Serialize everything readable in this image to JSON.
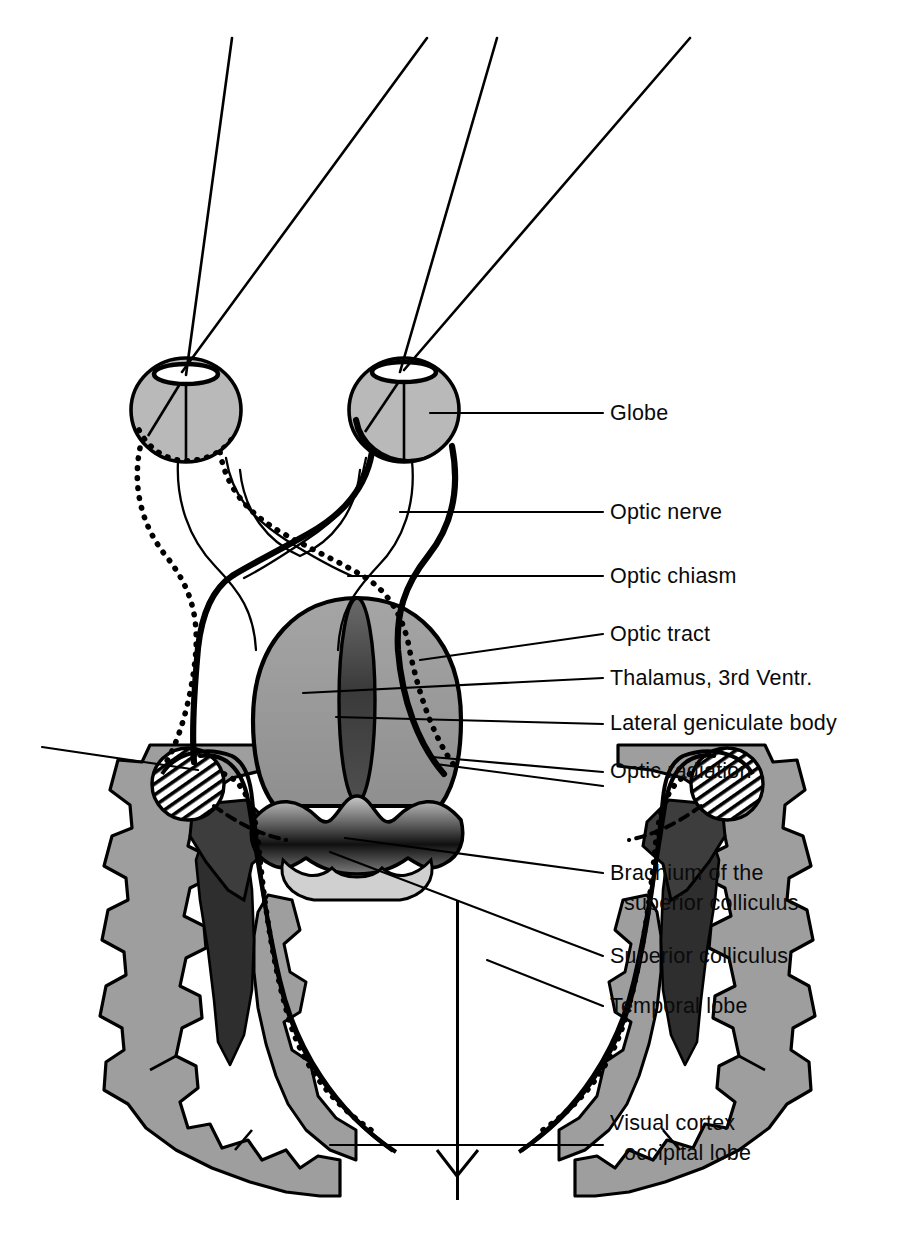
{
  "figure": {
    "type": "anatomical-diagram",
    "orientation": "axial / horizontal section, viewed from above",
    "background_color": "#ffffff",
    "line_color": "#000000"
  },
  "palette": {
    "ink": "#000000",
    "globe_fill": "#b9b9b9",
    "thalamus_fill": "#9a9a9a",
    "third_ventricle_fill": "#4a4a4a",
    "colliculus_fill": "#3d3d3d",
    "colliculus_dark": "#111111",
    "cortex_gray_matter": "#9e9e9e",
    "white_matter": "#ffffff",
    "ventricle_dark": "#2e2e2e",
    "lgb_hatch": "#000000"
  },
  "labels": [
    {
      "id": "globe",
      "line1": "Globe",
      "line2": "",
      "x": 610,
      "y": 420,
      "leader": {
        "x1": 603,
        "y1": 413,
        "x2": 430,
        "y2": 413
      }
    },
    {
      "id": "optic-nerve",
      "line1": "Optic  nerve",
      "line2": "",
      "x": 610,
      "y": 519,
      "leader": {
        "x1": 603,
        "y1": 512,
        "x2": 400,
        "y2": 512
      }
    },
    {
      "id": "optic-chiasm",
      "line1": "Optic  chiasm",
      "line2": "",
      "x": 610,
      "y": 583,
      "leader": {
        "x1": 603,
        "y1": 576,
        "x2": 348,
        "y2": 576
      }
    },
    {
      "id": "optic-tract",
      "line1": "Optic  tract",
      "line2": "",
      "x": 610,
      "y": 641,
      "leader": {
        "x1": 603,
        "y1": 634,
        "x2": 420,
        "y2": 660
      }
    },
    {
      "id": "thalamus",
      "line1": "Thalamus, 3rd  Ventr.",
      "line2": "",
      "x": 610,
      "y": 685,
      "leader": {
        "x1": 603,
        "y1": 678,
        "x2": 303,
        "y2": 693
      }
    },
    {
      "id": "lateral-geniculate",
      "line1": "Lateral  geniculate  body",
      "line2": "",
      "x": 610,
      "y": 730,
      "leader": {
        "x1": 603,
        "y1": 724,
        "x2": 336,
        "y2": 717
      }
    },
    {
      "id": "optic-radiation",
      "line1": "Optic  radiation",
      "line2": "",
      "x": 610,
      "y": 778,
      "leader": {
        "x1": 603,
        "y1": 772,
        "x2": 432,
        "y2": 757
      }
    },
    {
      "id": "brachium",
      "line1": "Brachium of the",
      "line2": "superior  colliculus",
      "x": 610,
      "y": 880,
      "leader": {
        "x1": 603,
        "y1": 873,
        "x2": 345,
        "y2": 838
      }
    },
    {
      "id": "superior-colliculus",
      "line1": "Superior  colliculus",
      "line2": "",
      "x": 610,
      "y": 963,
      "leader": {
        "x1": 603,
        "y1": 956,
        "x2": 330,
        "y2": 852
      }
    },
    {
      "id": "temporal-lobe",
      "line1": "Temporal  lobe",
      "line2": "",
      "x": 610,
      "y": 1013,
      "leader": {
        "x1": 603,
        "y1": 1006,
        "x2": 487,
        "y2": 960
      }
    },
    {
      "id": "visual-cortex",
      "line1": "Visual  cortex",
      "line2": "occipital  lobe",
      "x": 610,
      "y": 1130,
      "leader": {
        "x1": 603,
        "y1": 1145,
        "x2": 330,
        "y2": 1145
      }
    }
  ],
  "extra_leaders": [
    {
      "id": "optic-radiation-second",
      "x1": 603,
      "y1": 786,
      "x2": 436,
      "y2": 764
    },
    {
      "id": "lgb-left-leader",
      "x1": 198,
      "y1": 770,
      "x2": 42,
      "y2": 747
    }
  ],
  "visual_field_rays": [
    {
      "id": "ray-left-outer",
      "x1": 232,
      "y1": 38,
      "x2": 186,
      "y2": 375
    },
    {
      "id": "ray-left-inner",
      "x1": 427,
      "y1": 38,
      "x2": 182,
      "y2": 372
    },
    {
      "id": "ray-right-outer",
      "x1": 497,
      "y1": 38,
      "x2": 400,
      "y2": 372
    },
    {
      "id": "ray-right-inner",
      "x1": 690,
      "y1": 38,
      "x2": 404,
      "y2": 370
    }
  ],
  "eyes": [
    {
      "id": "left-globe",
      "cx": 186,
      "cy": 410,
      "rx": 55,
      "ry": 52,
      "lens_cx": 186,
      "lens_cy": 374,
      "lens_rx": 32,
      "lens_ry": 10
    },
    {
      "id": "right-globe",
      "cx": 404,
      "cy": 410,
      "rx": 55,
      "ry": 52,
      "lens_cx": 404,
      "lens_cy": 372,
      "lens_rx": 32,
      "lens_ry": 10
    }
  ],
  "pathway_legend": {
    "solid_thick": "Right eye (temporal + nasal) fibres — drawn as heavy solid line",
    "dotted": "Left eye fibres — drawn as heavy dotted line"
  }
}
